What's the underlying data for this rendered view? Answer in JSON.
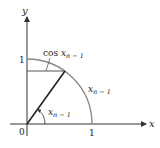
{
  "diagram": {
    "axes": {
      "x_label": "x",
      "y_label": "y",
      "origin_label": "0",
      "x_tick_label": "1",
      "y_tick_label": "1"
    },
    "labels": {
      "cos_label_prefix": "cos ",
      "cos_label_var": "x",
      "cos_label_sub": "n − 1",
      "arc_label_var": "x",
      "arc_label_sub": "n − 1",
      "angle_label_var": "x",
      "angle_label_sub": "n − 1"
    },
    "colors": {
      "axis": "#333333",
      "arc": "#777777",
      "radius_line": "#222222",
      "horizontal_line": "#555555"
    }
  }
}
